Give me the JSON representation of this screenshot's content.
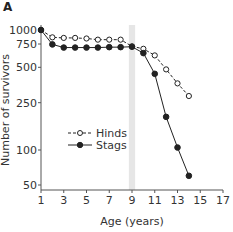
{
  "panel_label": "A",
  "chart_data": {
    "type": "line",
    "title": "",
    "xlabel": "Age (years)",
    "ylabel": "Number of survivors",
    "xlim": [
      1,
      17
    ],
    "ylim": [
      50,
      1000
    ],
    "yscale": "log",
    "x_ticks": [
      1,
      3,
      5,
      7,
      9,
      11,
      13,
      15,
      17
    ],
    "y_ticks": [
      50,
      100,
      250,
      500,
      750,
      1000
    ],
    "grid": false,
    "legend_position": "center-left",
    "highlight_band": {
      "x": 9,
      "width": 0.55,
      "color": "#e6e6e6"
    },
    "series": [
      {
        "name": "Hinds",
        "style": "dashed-open-circle",
        "x": [
          1,
          2,
          3,
          4,
          5,
          6,
          7,
          8,
          9,
          10,
          11,
          12,
          13,
          14
        ],
        "values": [
          1000,
          860,
          850,
          850,
          840,
          820,
          820,
          820,
          720,
          690,
          615,
          480,
          365,
          285
        ]
      },
      {
        "name": "Stags",
        "style": "solid-filled-circle",
        "x": [
          1,
          2,
          3,
          4,
          5,
          6,
          7,
          8,
          9,
          10,
          11,
          12,
          13,
          14
        ],
        "values": [
          1000,
          745,
          705,
          705,
          705,
          705,
          710,
          710,
          715,
          640,
          440,
          190,
          105,
          60
        ]
      }
    ]
  },
  "colors": {
    "axis": "#555555",
    "line": "#222222",
    "band": "#e6e6e6",
    "text": "#333333"
  }
}
